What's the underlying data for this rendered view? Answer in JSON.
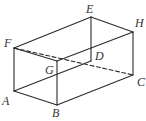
{
  "diagram": {
    "type": "rectangular-prism",
    "stroke_color": "#2b2b2b",
    "label_color": "#333333",
    "vertices": {
      "A": {
        "x": 14,
        "y": 91,
        "label": "A",
        "lx": 2,
        "ly": 95
      },
      "B": {
        "x": 57,
        "y": 105,
        "label": "B",
        "lx": 52,
        "ly": 107
      },
      "C": {
        "x": 133,
        "y": 75,
        "label": "C",
        "lx": 137,
        "ly": 76
      },
      "D": {
        "x": 91,
        "y": 61,
        "label": "D",
        "lx": 95,
        "ly": 50
      },
      "E": {
        "x": 91,
        "y": 17,
        "label": "E",
        "lx": 86,
        "ly": 3
      },
      "F": {
        "x": 14,
        "y": 48,
        "label": "F",
        "lx": 4,
        "ly": 37
      },
      "G": {
        "x": 57,
        "y": 61,
        "label": "G",
        "lx": 45,
        "ly": 64
      },
      "H": {
        "x": 133,
        "y": 32,
        "label": "H",
        "lx": 135,
        "ly": 17
      }
    },
    "solid_edges": [
      [
        "F",
        "E"
      ],
      [
        "E",
        "H"
      ],
      [
        "H",
        "G"
      ],
      [
        "G",
        "F"
      ],
      [
        "F",
        "A"
      ],
      [
        "G",
        "B"
      ],
      [
        "H",
        "C"
      ],
      [
        "E",
        "D"
      ],
      [
        "A",
        "B"
      ],
      [
        "B",
        "C"
      ],
      [
        "A",
        "D"
      ]
    ],
    "dashed_edges": [
      [
        "F",
        "C"
      ]
    ]
  }
}
